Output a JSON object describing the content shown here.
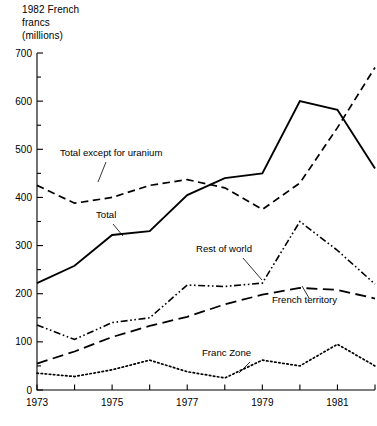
{
  "chart_data": {
    "type": "line",
    "title": "1982 French\nfrancs\n(millions)",
    "xlabel": "",
    "ylabel": "1982 French francs (millions)",
    "xlim": [
      1973,
      1982
    ],
    "ylim": [
      0,
      700
    ],
    "yticks": [
      0,
      100,
      200,
      300,
      400,
      500,
      600,
      700
    ],
    "ytick_labels": [
      "0",
      "100",
      "200",
      "300",
      "400",
      "500",
      "600",
      "700"
    ],
    "yminor_step": 50,
    "xticks": [
      1973,
      1974,
      1975,
      1976,
      1977,
      1978,
      1979,
      1980,
      1981,
      1982
    ],
    "xtick_labels": [
      "1973",
      "",
      "1975",
      "",
      "1977",
      "",
      "1979",
      "",
      "1981",
      ""
    ],
    "grid": false,
    "legend_position": "inline-annotations",
    "x": [
      1973,
      1974,
      1975,
      1976,
      1977,
      1978,
      1979,
      1980,
      1981,
      1982
    ],
    "series": [
      {
        "name": "Total except for uranium",
        "style": "dashed",
        "values": [
          425,
          388,
          400,
          425,
          437,
          420,
          375,
          430,
          545,
          670
        ]
      },
      {
        "name": "Total",
        "style": "solid",
        "values": [
          222,
          258,
          322,
          330,
          405,
          440,
          450,
          600,
          582,
          460
        ]
      },
      {
        "name": "Rest of world",
        "style": "dash-dot-dot",
        "values": [
          135,
          105,
          140,
          150,
          218,
          215,
          222,
          350,
          290,
          220
        ]
      },
      {
        "name": "French territory",
        "style": "long-dash",
        "values": [
          55,
          80,
          110,
          133,
          152,
          178,
          198,
          212,
          208,
          190
        ]
      },
      {
        "name": "Franc Zone",
        "style": "dotted",
        "values": [
          35,
          28,
          42,
          62,
          38,
          25,
          62,
          50,
          95,
          50
        ]
      }
    ],
    "annotations": [
      {
        "text": "Total except for uranium",
        "x": 60,
        "y": 156
      },
      {
        "text": "Total",
        "x": 96,
        "y": 218
      },
      {
        "text": "Rest of world",
        "x": 196,
        "y": 252
      },
      {
        "text": "French territory",
        "x": 272,
        "y": 303
      },
      {
        "text": "Franc Zone",
        "x": 202,
        "y": 356
      }
    ]
  }
}
